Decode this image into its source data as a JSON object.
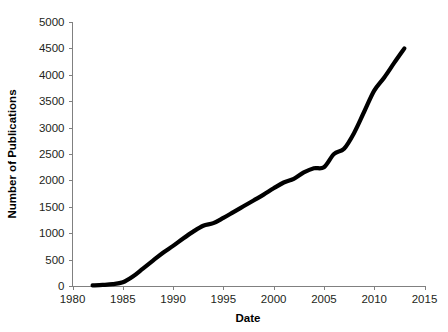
{
  "chart_data": {
    "type": "line",
    "title": "",
    "xlabel": "Date",
    "ylabel": "Number of Publications",
    "xlim": [
      1980,
      2015
    ],
    "ylim": [
      0,
      5000
    ],
    "grid": false,
    "legend": null,
    "x_ticks": [
      "1980",
      "1985",
      "1990",
      "1995",
      "2000",
      "2005",
      "2010",
      "2015"
    ],
    "x_tick_values": [
      1980,
      1985,
      1990,
      1995,
      2000,
      2005,
      2010,
      2015
    ],
    "y_ticks": [
      "0",
      "500",
      "1000",
      "1500",
      "2000",
      "2500",
      "3000",
      "3500",
      "4000",
      "4500",
      "5000"
    ],
    "y_tick_values": [
      0,
      500,
      1000,
      1500,
      2000,
      2500,
      3000,
      3500,
      4000,
      4500,
      5000
    ],
    "series": [
      {
        "name": "Publications",
        "color": "#000000",
        "x": [
          1982,
          1983,
          1984,
          1985,
          1986,
          1987,
          1988,
          1989,
          1990,
          1991,
          1992,
          1993,
          1994,
          1995,
          1996,
          1997,
          1998,
          1999,
          2000,
          2001,
          2002,
          2003,
          2004,
          2005,
          2006,
          2007,
          2008,
          2009,
          2010,
          2011,
          2012,
          2013
        ],
        "values": [
          10,
          20,
          35,
          70,
          180,
          330,
          480,
          630,
          760,
          900,
          1030,
          1140,
          1190,
          1290,
          1400,
          1510,
          1620,
          1730,
          1850,
          1960,
          2030,
          2150,
          2230,
          2250,
          2500,
          2600,
          2900,
          3300,
          3700,
          3950,
          4230,
          4500
        ]
      }
    ]
  },
  "axis_titles": {
    "x": "Date",
    "y": "Number of Publications"
  },
  "colors": {
    "line": "#000000",
    "axis": "#808080",
    "tick_label": "#231f20",
    "background": "#ffffff"
  }
}
